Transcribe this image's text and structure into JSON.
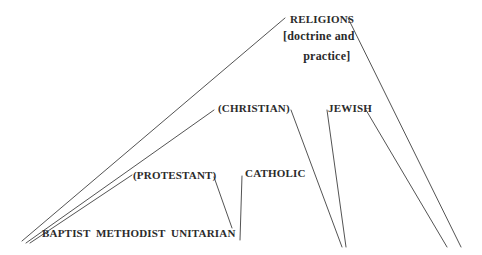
{
  "diagram": {
    "type": "tree",
    "title": "RELIGIONS",
    "background_color": "#ffffff",
    "line_color": "#404040",
    "text_color": "#2b2b2b",
    "nodes": [
      {
        "id": "religions",
        "label": "RELIGIONS",
        "level": 0,
        "x": 290,
        "y": 14,
        "parenthetical": false
      },
      {
        "id": "religions-gloss-1",
        "label": "[doctrine and",
        "level": 0,
        "x": 283,
        "y": 32,
        "parenthetical": false
      },
      {
        "id": "religions-gloss-2",
        "label": "practice]",
        "level": 0,
        "x": 301,
        "y": 56,
        "parenthetical": false
      },
      {
        "id": "christian",
        "label": "(CHRISTIAN)",
        "level": 1,
        "x": 218,
        "y": 106,
        "parenthetical": true
      },
      {
        "id": "jewish",
        "label": "JEWISH",
        "level": 1,
        "x": 328,
        "y": 106,
        "parenthetical": false
      },
      {
        "id": "protestant",
        "label": "(PROTESTANT)",
        "level": 2,
        "x": 133,
        "y": 173,
        "parenthetical": true
      },
      {
        "id": "catholic",
        "label": "CATHOLIC",
        "level": 2,
        "x": 245,
        "y": 171,
        "parenthetical": false
      },
      {
        "id": "baptist",
        "label": "BAPTIST",
        "level": 3,
        "x": 42,
        "y": 230,
        "parenthetical": false
      },
      {
        "id": "methodist",
        "label": "METHODIST",
        "level": 3,
        "x": 96,
        "y": 230,
        "parenthetical": false
      },
      {
        "id": "unitarian",
        "label": "UNITARIAN",
        "level": 3,
        "x": 171,
        "y": 230,
        "parenthetical": false
      }
    ],
    "edges": [
      {
        "id": "edge-religions-left",
        "from": "religions",
        "to": "baptist-fan",
        "x1": 285,
        "y1": 18,
        "x2": 22,
        "y2": 241
      },
      {
        "id": "edge-religions-right",
        "from": "religions",
        "to": "far-right-fan",
        "x1": 348,
        "y1": 18,
        "x2": 461,
        "y2": 247
      },
      {
        "id": "edge-christian-left",
        "from": "christian",
        "to": "baptist-fan",
        "x1": 214,
        "y1": 110,
        "x2": 26,
        "y2": 243
      },
      {
        "id": "edge-christian-right",
        "from": "christian",
        "to": "catholic-fan",
        "x1": 291,
        "y1": 110,
        "x2": 342,
        "y2": 247
      },
      {
        "id": "edge-jewish-left",
        "from": "jewish",
        "to": "jewish-fan",
        "x1": 327,
        "y1": 110,
        "x2": 346,
        "y2": 247
      },
      {
        "id": "edge-jewish-right",
        "from": "jewish",
        "to": "far-right-fan",
        "x1": 366,
        "y1": 110,
        "x2": 447,
        "y2": 247
      },
      {
        "id": "edge-protestant-left",
        "from": "protestant",
        "to": "baptist-fan",
        "x1": 132,
        "y1": 175,
        "x2": 30,
        "y2": 243
      },
      {
        "id": "edge-protestant-right",
        "from": "protestant",
        "to": "unitarian",
        "x1": 214,
        "y1": 177,
        "x2": 232,
        "y2": 228
      },
      {
        "id": "edge-catholic-down",
        "from": "catholic",
        "to": "catholic-fan",
        "x1": 242,
        "y1": 176,
        "x2": 240,
        "y2": 240
      }
    ]
  },
  "meta": {
    "node_count": 9,
    "leaf_labels": [
      "BAPTIST",
      "METHODIST",
      "UNITARIAN"
    ]
  }
}
